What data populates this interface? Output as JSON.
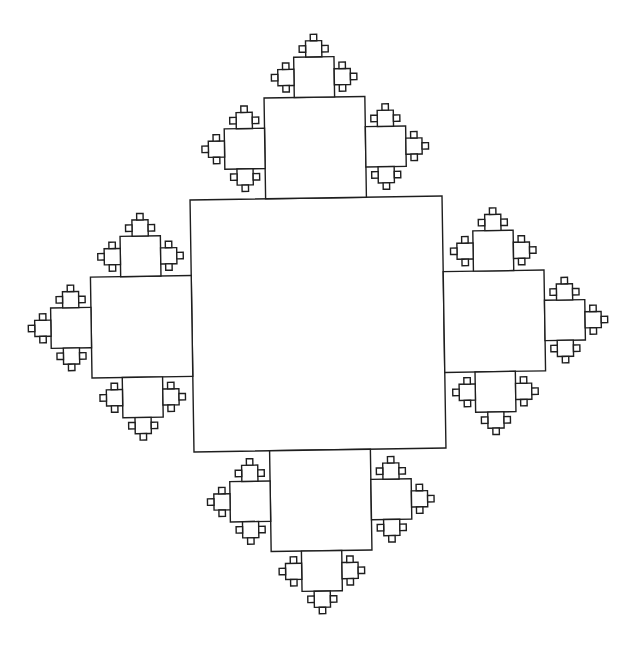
{
  "figure": {
    "background": "#ffffff",
    "stroke_color": "#1e1e1e",
    "stroke_width": 1.4,
    "root_square": {
      "center_x": 318,
      "center_y": 324,
      "size": 252,
      "rotation_deg": -0.9
    },
    "child_scale": 0.4,
    "levels": 5,
    "level_sizes_px": [
      252,
      101,
      40,
      16,
      6.5
    ],
    "root_children_directions": [
      "up",
      "right",
      "down",
      "left"
    ],
    "children_per_square": 3
  },
  "caption": {
    "text": ""
  }
}
